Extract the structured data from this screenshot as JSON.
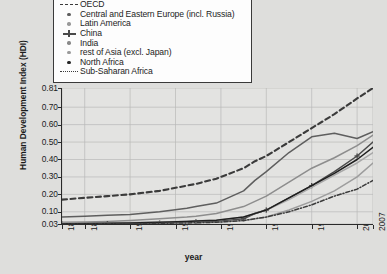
{
  "chart_data": {
    "type": "line",
    "title": "",
    "xlabel": "year",
    "ylabel": "Human Development Index (HDI)",
    "xlim": [
      1870,
      2007
    ],
    "ylim": [
      0.03,
      0.81
    ],
    "grid": true,
    "legend_position": "top",
    "xticks": [
      "1870",
      "1880",
      "1900",
      "1920",
      "1940",
      "1960",
      "1980",
      "2000",
      "2007"
    ],
    "xtick_values": [
      1870,
      1880,
      1900,
      1920,
      1940,
      1960,
      1980,
      2000,
      2007
    ],
    "yticks": [
      "0.03",
      "0.10",
      "0.20",
      "0.30",
      "0.40",
      "0.50",
      "0.60",
      "0.70",
      "0.81"
    ],
    "ytick_values": [
      0.03,
      0.1,
      0.2,
      0.3,
      0.4,
      0.5,
      0.6,
      0.7,
      0.81
    ],
    "x": [
      1870,
      1880,
      1890,
      1900,
      1913,
      1925,
      1929,
      1938,
      1950,
      1955,
      1960,
      1970,
      1980,
      1990,
      2000,
      2007
    ],
    "series": [
      {
        "name": "OECD",
        "marker": "dashed-line",
        "color": "#3b3b3b",
        "values": [
          0.17,
          0.18,
          0.19,
          0.2,
          0.22,
          0.25,
          0.26,
          0.29,
          0.35,
          0.39,
          0.42,
          0.5,
          0.58,
          0.66,
          0.75,
          0.81
        ]
      },
      {
        "name": "Central and Eastern Europe (incl. Russia)",
        "marker": "dot",
        "color": "#5e5e5e",
        "values": [
          0.07,
          0.075,
          0.08,
          0.085,
          0.1,
          0.12,
          0.13,
          0.15,
          0.22,
          0.28,
          0.33,
          0.44,
          0.53,
          0.55,
          0.52,
          0.56
        ]
      },
      {
        "name": "Latin America",
        "marker": "dot-light",
        "color": "#8d8d8d",
        "values": [
          0.04,
          0.042,
          0.045,
          0.05,
          0.06,
          0.07,
          0.075,
          0.09,
          0.13,
          0.16,
          0.19,
          0.27,
          0.35,
          0.41,
          0.48,
          0.54
        ]
      },
      {
        "name": "China",
        "marker": "cross",
        "color": "#4a4a4a",
        "values": [
          0.03,
          0.031,
          0.032,
          0.033,
          0.035,
          0.04,
          0.042,
          0.045,
          0.06,
          0.09,
          0.11,
          0.18,
          0.25,
          0.33,
          0.42,
          0.5
        ]
      },
      {
        "name": "India",
        "marker": "dot-faint",
        "color": "#9d9d9d",
        "values": [
          0.03,
          0.03,
          0.031,
          0.032,
          0.034,
          0.037,
          0.038,
          0.04,
          0.05,
          0.06,
          0.07,
          0.11,
          0.16,
          0.22,
          0.3,
          0.38
        ]
      },
      {
        "name": "rest of Asia (excl. Japan)",
        "marker": "dot-pale",
        "color": "#a8a8a8",
        "values": [
          0.035,
          0.036,
          0.037,
          0.039,
          0.042,
          0.046,
          0.048,
          0.052,
          0.07,
          0.09,
          0.11,
          0.17,
          0.24,
          0.31,
          0.38,
          0.44
        ]
      },
      {
        "name": "North Africa",
        "marker": "dot-dark",
        "color": "#1f1f1f",
        "values": [
          0.032,
          0.033,
          0.034,
          0.036,
          0.04,
          0.045,
          0.047,
          0.052,
          0.07,
          0.09,
          0.11,
          0.18,
          0.25,
          0.32,
          0.4,
          0.47
        ]
      },
      {
        "name": "Sub-Saharan Africa",
        "marker": "dash-dot-line",
        "color": "#3b3b3b",
        "values": [
          0.03,
          0.03,
          0.031,
          0.032,
          0.034,
          0.036,
          0.037,
          0.04,
          0.05,
          0.06,
          0.07,
          0.1,
          0.14,
          0.19,
          0.23,
          0.28
        ]
      }
    ]
  },
  "legend": {
    "items": [
      {
        "label": "OECD",
        "key": "dashed"
      },
      {
        "label": "Central and Eastern Europe (incl. Russia)",
        "key": "dot"
      },
      {
        "label": "Latin America",
        "key": "dot-light"
      },
      {
        "label": "China",
        "key": "cross"
      },
      {
        "label": "India",
        "key": "dot-faint"
      },
      {
        "label": "rest of Asia (excl. Japan)",
        "key": "dot-pale"
      },
      {
        "label": "North Africa",
        "key": "dot-dark"
      },
      {
        "label": "Sub-Saharan Africa",
        "key": "dash-dot"
      }
    ]
  }
}
